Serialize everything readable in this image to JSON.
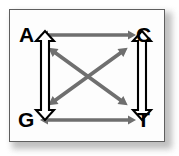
{
  "figure": {
    "kind": "nucleotide-substitution-diagram",
    "title": "",
    "frame": {
      "border_color": "#5f5f5f",
      "background_color": "#fdfdfd",
      "shadow_color": "#b4b4b4"
    },
    "nodes": [
      {
        "id": "A",
        "label": "A",
        "position": "top-left"
      },
      {
        "id": "C",
        "label": "C",
        "position": "top-right"
      },
      {
        "id": "G",
        "label": "G",
        "position": "bottom-left"
      },
      {
        "id": "T",
        "label": "T",
        "position": "bottom-right"
      }
    ],
    "edges": [
      {
        "id": "A-C",
        "from": "A",
        "to": "C",
        "style": "solid-gray",
        "heads": "double",
        "orientation": "horizontal-top",
        "color": "#6f6f6f"
      },
      {
        "id": "G-T",
        "from": "G",
        "to": "T",
        "style": "solid-gray",
        "heads": "double",
        "orientation": "horizontal-bottom",
        "color": "#6f6f6f"
      },
      {
        "id": "A-G",
        "from": "A",
        "to": "G",
        "style": "hollow-outline",
        "heads": "double",
        "orientation": "vertical-left",
        "color": "#000000",
        "fill": "#ffffff"
      },
      {
        "id": "C-T",
        "from": "C",
        "to": "T",
        "style": "hollow-outline",
        "heads": "double",
        "orientation": "vertical-right",
        "color": "#000000",
        "fill": "#ffffff"
      },
      {
        "id": "A-T",
        "from": "A",
        "to": "T",
        "style": "solid-gray",
        "heads": "double",
        "orientation": "diagonal-down-right",
        "color": "#6f6f6f"
      },
      {
        "id": "G-C",
        "from": "G",
        "to": "C",
        "style": "solid-gray",
        "heads": "double",
        "orientation": "diagonal-up-right",
        "color": "#6f6f6f"
      }
    ],
    "colors": {
      "arrow_gray": "#6f6f6f",
      "arrow_outline": "#000000",
      "arrow_fill": "#ffffff",
      "text": "#000000"
    }
  }
}
